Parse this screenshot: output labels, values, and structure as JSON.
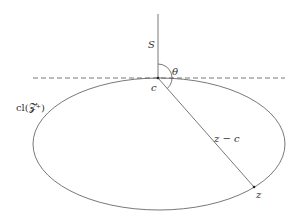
{
  "diagram": {
    "labels": {
      "S": "S",
      "theta": "θ",
      "c": "c",
      "set": "cl(𝓩⁺)",
      "segment": "z − c",
      "z": "z"
    },
    "colors": {
      "stroke": "#555555",
      "text": "#333333",
      "background": "#ffffff"
    },
    "elements": [
      "vertical ray S from point c",
      "horizontal dashed tangent line through c",
      "ellipse representing closure of Z+",
      "segment from c to z",
      "angle arc theta between S and z−c"
    ]
  }
}
